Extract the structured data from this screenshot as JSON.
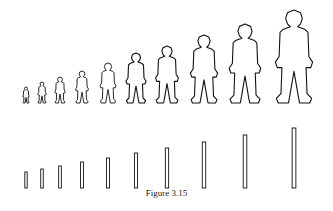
{
  "caption": "Figure 3.15",
  "stroke_color": "#111111",
  "fill_color": "#ffffff",
  "figures": {
    "description": "Human silhouettes increasing in size",
    "relative_heights": [
      16,
      21,
      26,
      32,
      40,
      50,
      57,
      68,
      79,
      93
    ]
  },
  "bars": {
    "description": "Vertical bars increasing in height, matching figure sizes",
    "relative_heights": [
      16,
      19,
      22,
      26,
      30,
      35,
      40,
      46,
      53,
      60
    ]
  }
}
